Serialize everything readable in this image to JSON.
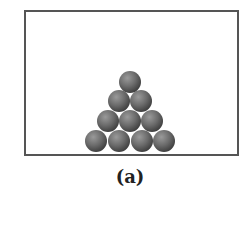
{
  "figure": {
    "label": "(a)",
    "sphere_color": "#6b6b6b",
    "frame_color": "#555555",
    "rows": [
      {
        "count": 1,
        "cy": 82,
        "cx": [
          130
        ]
      },
      {
        "count": 2,
        "cy": 101,
        "cx": [
          119,
          141
        ]
      },
      {
        "count": 3,
        "cy": 121,
        "cx": [
          108,
          130,
          152
        ]
      },
      {
        "count": 4,
        "cy": 141,
        "cx": [
          96,
          119,
          142,
          164
        ]
      }
    ],
    "sphere_radius": 11
  }
}
